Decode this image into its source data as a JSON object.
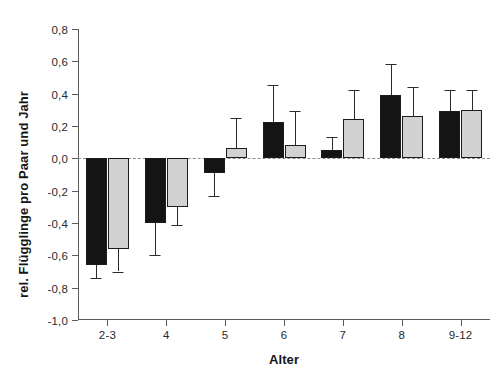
{
  "chart_data": {
    "type": "bar",
    "title": "",
    "subtitle": "",
    "xlabel": "Alter",
    "ylabel": "rel. Flügglinge pro Paar und Jahr",
    "categories": [
      "2-3",
      "4",
      "5",
      "6",
      "7",
      "8",
      "9-12"
    ],
    "ylim": [
      -1.0,
      0.8
    ],
    "ytick_values": [
      0.8,
      0.6,
      0.4,
      0.2,
      0.0,
      -0.2,
      -0.4,
      -0.6,
      -0.8,
      -1.0
    ],
    "ytick_labels": [
      "0,8",
      "0,6",
      "0,4",
      "0,2",
      "0,0",
      "-0,2",
      "-0,4",
      "-0,6",
      "-0,8",
      "-1,0"
    ],
    "grid": false,
    "legend": "none",
    "zero_reference_line": true,
    "series": [
      {
        "name": "series-dark",
        "color": "#141414",
        "values": [
          -0.66,
          -0.4,
          -0.09,
          0.225,
          0.05,
          0.39,
          0.29
        ],
        "errors_low": [
          -0.74,
          -0.6,
          -0.23,
          0.0,
          0.0,
          0.0,
          0.0
        ],
        "errors_high": [
          -0.66,
          -0.4,
          -0.09,
          0.455,
          0.135,
          0.585,
          0.425
        ]
      },
      {
        "name": "series-light",
        "color": "#d2d2d2",
        "values": [
          -0.56,
          -0.3,
          0.065,
          0.085,
          0.245,
          0.26,
          0.3
        ],
        "errors_low": [
          -0.7,
          -0.41,
          0.065,
          0.085,
          0.245,
          0.26,
          0.3
        ],
        "errors_high": [
          -0.56,
          -0.3,
          0.25,
          0.29,
          0.42,
          0.44,
          0.42
        ]
      }
    ]
  },
  "axis": {
    "x_title": "Alter",
    "y_title": "rel. Flügglinge pro Paar und Jahr"
  },
  "colors": {
    "dark_bar": "#141414",
    "light_bar": "#d2d2d2",
    "axis": "#5a5a5a",
    "background": "#ffffff"
  }
}
